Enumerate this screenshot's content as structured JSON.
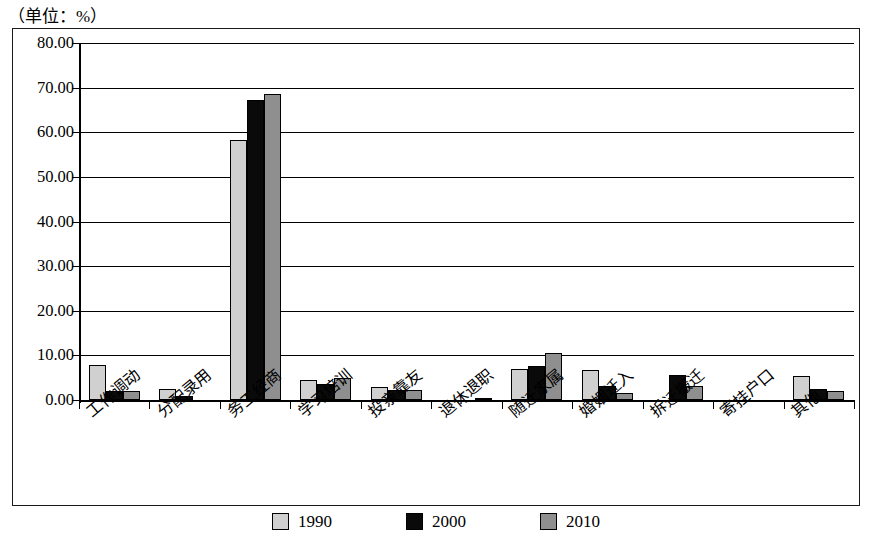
{
  "caption": "（单位：%）",
  "chart_data": {
    "type": "bar",
    "title": "",
    "subtitle": "",
    "unit_note": "（单位：%）",
    "xlabel": "",
    "ylabel": "",
    "ylim": [
      0,
      80
    ],
    "ytick_step": 10,
    "ytick_labels": [
      "80.00",
      "70.00",
      "60.00",
      "50.00",
      "40.00",
      "30.00",
      "20.00",
      "10.00",
      "0.00"
    ],
    "ytick_values": [
      80,
      70,
      60,
      50,
      40,
      30,
      20,
      10,
      0
    ],
    "grid": true,
    "grid_axis": "y",
    "legend_position": "bottom",
    "categories": [
      "工作调动",
      "分配录用",
      "务工经商",
      "学习培训",
      "投亲靠友",
      "退休退职",
      "随迁家属",
      "婚姻迁入",
      "拆迁搬迁",
      "寄挂户口",
      "其他"
    ],
    "series": [
      {
        "name": "1990",
        "color": "#d0d0d0",
        "values": [
          7.8,
          2.5,
          58.3,
          4.5,
          3.0,
          0.0,
          7.0,
          6.7,
          0.0,
          0.0,
          5.3
        ]
      },
      {
        "name": "2000",
        "color": "#0a0a0a",
        "values": [
          2.1,
          0.9,
          67.3,
          3.5,
          2.3,
          0.0,
          7.7,
          3.2,
          5.7,
          0.0,
          2.5
        ]
      },
      {
        "name": "2010",
        "color": "#8f8f8f",
        "values": [
          2.0,
          0.0,
          68.6,
          5.0,
          2.2,
          0.5,
          10.5,
          1.6,
          3.2,
          0.1,
          2.1
        ]
      }
    ]
  },
  "legend": {
    "items": [
      {
        "label": "1990",
        "swatch": "legend-swatch-1990"
      },
      {
        "label": "2000",
        "swatch": "legend-swatch-2000"
      },
      {
        "label": "2010",
        "swatch": "legend-swatch-2010"
      }
    ]
  }
}
